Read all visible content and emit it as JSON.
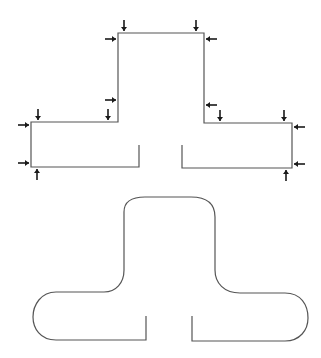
{
  "diagram": {
    "colors": {
      "outline": "#555555",
      "arrow": "#1a1a1a",
      "background": "#ffffff"
    },
    "upper_shape": {
      "name": "sharp-t-outline",
      "corner_style": "sharp",
      "arrow_count": 16
    },
    "lower_shape": {
      "name": "rounded-t-outline",
      "corner_style": "rounded"
    },
    "arrows": [
      {
        "id": "top-left-down",
        "direction": "down"
      },
      {
        "id": "top-right-down",
        "direction": "down"
      },
      {
        "id": "top-left-right",
        "direction": "right"
      },
      {
        "id": "top-right-left",
        "direction": "left"
      },
      {
        "id": "mid-left-right",
        "direction": "right"
      },
      {
        "id": "mid-right-left",
        "direction": "left"
      },
      {
        "id": "inner-left-down",
        "direction": "down"
      },
      {
        "id": "outer-left-down",
        "direction": "down"
      },
      {
        "id": "inner-right-down",
        "direction": "down"
      },
      {
        "id": "outer-right-down",
        "direction": "down"
      },
      {
        "id": "left-top-right",
        "direction": "right"
      },
      {
        "id": "left-bottom-right",
        "direction": "right"
      },
      {
        "id": "left-bottom-up",
        "direction": "up"
      },
      {
        "id": "right-top-left",
        "direction": "left"
      },
      {
        "id": "right-bottom-left",
        "direction": "left"
      },
      {
        "id": "right-bottom-up",
        "direction": "up"
      }
    ]
  }
}
